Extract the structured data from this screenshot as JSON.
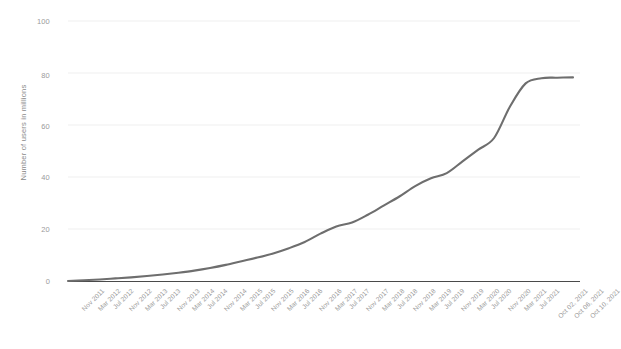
{
  "chart_data": {
    "type": "line",
    "title": "",
    "xlabel": "",
    "ylabel": "Number of users in millions",
    "ylim": [
      0,
      100
    ],
    "yticks": [
      0,
      20,
      40,
      60,
      80,
      100
    ],
    "ytick_labels": [
      "0",
      "20",
      "40",
      "60",
      "80",
      "100"
    ],
    "grid": true,
    "legend": "none",
    "line_color": "#6e6e6e",
    "grid_color": "#efefef",
    "axis_color": "#444444",
    "categories": [
      "Nov 2011",
      "Mar 2012",
      "Jul 2012",
      "Nov 2012",
      "Mar 2013",
      "Jul 2013",
      "Nov 2013",
      "Mar 2014",
      "Jul 2014",
      "Nov 2014",
      "Mar 2015",
      "Jul 2015",
      "Nov 2015",
      "Mar 2016",
      "Jul 2016",
      "Nov 2016",
      "Mar 2017",
      "Jul 2017",
      "Nov 2017",
      "Mar 2018",
      "Jul 2018",
      "Nov 2018",
      "Mar 2019",
      "Jul 2019",
      "Nov 2019",
      "Mar 2020",
      "Jul 2020",
      "Nov 2020",
      "Mar 2021",
      "Jul 2021",
      "Oct 02, 2021",
      "Oct 06, 2021",
      "Oct 10, 2021"
    ],
    "series": [
      {
        "name": "Number of users in millions",
        "values": [
          0.0,
          0.3,
          0.6,
          1.0,
          1.4,
          1.9,
          2.5,
          3.2,
          4.0,
          5.0,
          6.2,
          7.6,
          9.0,
          10.6,
          12.6,
          15.0,
          18.2,
          21.0,
          22.5,
          25.5,
          29.0,
          32.5,
          36.5,
          39.5,
          41.5,
          46.0,
          50.5,
          55.0,
          67.0,
          76.0,
          78.0,
          78.2,
          78.3
        ]
      }
    ]
  }
}
